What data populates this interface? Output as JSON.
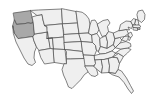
{
  "map": {
    "title": "United States",
    "type": "choropleth",
    "width": 167,
    "height": 109,
    "background_color": "#ffffff",
    "default_fill": "#efefef",
    "highlight_fill": "#a8a8a8",
    "border_color": "#4d4d4d",
    "border_width": 0.7,
    "highlighted_states": [
      "Washington",
      "Oregon"
    ],
    "legend_visible": false,
    "labels_visible": false
  },
  "chart_data": {
    "type": "map",
    "xlabel": "",
    "ylabel": "",
    "categories": [
      "Washington",
      "Oregon",
      "California",
      "Nevada",
      "Idaho",
      "Montana",
      "Wyoming",
      "Utah",
      "Arizona",
      "Colorado",
      "New Mexico",
      "North Dakota",
      "South Dakota",
      "Nebraska",
      "Kansas",
      "Oklahoma",
      "Texas",
      "Minnesota",
      "Iowa",
      "Missouri",
      "Arkansas",
      "Louisiana",
      "Wisconsin",
      "Illinois",
      "Michigan",
      "Indiana",
      "Ohio",
      "Kentucky",
      "Tennessee",
      "Mississippi",
      "Alabama",
      "Georgia",
      "Florida",
      "South Carolina",
      "North Carolina",
      "Virginia",
      "West Virginia",
      "Pennsylvania",
      "New York",
      "Maine",
      "Vermont",
      "New Hampshire",
      "Massachusetts",
      "Rhode Island",
      "Connecticut",
      "New Jersey",
      "Delaware",
      "Maryland"
    ],
    "values": [
      1,
      1,
      0,
      0,
      0,
      0,
      0,
      0,
      0,
      0,
      0,
      0,
      0,
      0,
      0,
      0,
      0,
      0,
      0,
      0,
      0,
      0,
      0,
      0,
      0,
      0,
      0,
      0,
      0,
      0,
      0,
      0,
      0,
      0,
      0,
      0,
      0,
      0,
      0,
      0,
      0,
      0,
      0,
      0,
      0,
      0,
      0,
      0
    ],
    "value_legend": {
      "0": "not selected",
      "1": "selected"
    },
    "colors": {
      "0": "#efefef",
      "1": "#a8a8a8"
    },
    "grid": false,
    "legend_position": "none"
  },
  "states": [
    {
      "name": "Washington",
      "abbr": "WA",
      "selected": true,
      "path": "M13.5,13.0 L30.5,10.6 L32.0,17.0 L33.2,22.5 L31.0,23.4 L28.0,22.8 L25.0,23.6 L16.5,24.4 L14.5,20.0 Z"
    },
    {
      "name": "Oregon",
      "abbr": "OR",
      "selected": true,
      "path": "M14.5,20.0 L16.5,24.4 L25.0,23.6 L28.0,22.8 L31.0,23.4 L33.2,22.5 L34.6,34.0 L33.0,36.5 L18.0,38.6 L14.2,33.0 L12.8,26.0 Z"
    },
    {
      "name": "California",
      "abbr": "CA",
      "selected": false,
      "path": "M12.8,26.0 L14.2,33.0 L18.0,38.6 L33.0,36.5 L34.0,41.0 L36.5,47.0 L34.5,52.0 L34.0,58.0 L35.5,62.5 L32.0,65.5 L28.0,64.0 L24.0,58.0 L20.0,50.0 L16.0,42.0 L13.5,34.0 Z"
    },
    {
      "name": "Nevada",
      "abbr": "NV",
      "selected": false,
      "path": "M33.0,36.5 L34.6,34.0 L47.5,32.0 L50.5,48.5 L39.0,50.5 L36.5,47.0 L34.0,41.0 Z"
    },
    {
      "name": "Idaho",
      "abbr": "ID",
      "selected": false,
      "path": "M33.2,22.5 L32.0,17.0 L37.0,15.5 L42.0,14.5 L43.0,20.0 L44.5,25.5 L47.0,27.0 L47.5,32.0 L34.6,34.0 Z"
    },
    {
      "name": "Montana",
      "abbr": "MT",
      "selected": false,
      "path": "M30.5,10.6 L37.0,15.5 L42.0,14.5 L43.0,20.0 L44.5,25.5 L62.5,23.8 L61.5,9.0 L38.5,10.0 L32.0,10.4 Z"
    },
    {
      "name": "Wyoming",
      "abbr": "WY",
      "selected": false,
      "path": "M44.5,25.5 L62.5,23.8 L63.8,37.0 L47.0,38.5 L47.0,27.0 Z"
    },
    {
      "name": "Utah",
      "abbr": "UT",
      "selected": false,
      "path": "M47.5,32.0 L47.0,38.5 L52.5,38.2 L53.5,49.0 L50.5,48.5 Z"
    },
    {
      "name": "Arizona",
      "abbr": "AZ",
      "selected": false,
      "path": "M39.0,50.5 L50.5,48.5 L53.5,49.0 L54.5,62.5 L44.5,64.0 L41.0,58.0 Z"
    },
    {
      "name": "Colorado",
      "abbr": "CO",
      "selected": false,
      "path": "M47.0,38.5 L63.8,37.0 L65.0,49.5 L53.5,49.0 L52.5,38.2 Z"
    },
    {
      "name": "New Mexico",
      "abbr": "NM",
      "selected": false,
      "path": "M53.5,49.0 L65.0,49.5 L66.5,63.5 L64.0,64.0 L54.5,62.5 Z"
    },
    {
      "name": "North Dakota",
      "abbr": "ND",
      "selected": false,
      "path": "M61.5,9.0 L62.5,23.8 L77.5,23.0 L76.0,11.5 L66.0,9.5 Z"
    },
    {
      "name": "South Dakota",
      "abbr": "SD",
      "selected": false,
      "path": "M62.5,23.8 L77.5,23.0 L79.0,33.5 L63.8,34.5 L63.5,30.0 Z"
    },
    {
      "name": "Nebraska",
      "abbr": "NE",
      "selected": false,
      "path": "M63.8,34.5 L79.0,33.5 L81.5,41.5 L64.2,42.5 L63.8,37.0 Z"
    },
    {
      "name": "Kansas",
      "abbr": "KS",
      "selected": false,
      "path": "M64.2,42.5 L81.5,41.5 L82.5,51.5 L65.0,49.5 Z"
    },
    {
      "name": "Oklahoma",
      "abbr": "OK",
      "selected": false,
      "path": "M65.0,49.5 L82.5,51.5 L84.0,58.5 L70.5,59.0 L66.5,59.0 L66.4,55.5 L66.5,52.0 Z"
    },
    {
      "name": "Texas",
      "abbr": "TX",
      "selected": false,
      "path": "M66.5,63.5 L66.5,59.0 L70.5,59.0 L84.0,58.5 L86.5,62.5 L89.5,67.0 L88.0,72.0 L84.5,74.5 L80.5,80.0 L76.0,84.5 L72.0,88.5 L68.5,87.0 L66.0,80.5 L63.5,75.0 L62.0,69.5 L64.0,64.0 Z"
    },
    {
      "name": "Minnesota",
      "abbr": "MN",
      "selected": false,
      "path": "M76.0,11.5 L77.5,23.0 L79.0,33.5 L88.5,33.0 L90.0,25.0 L89.0,19.0 L86.0,15.0 L82.5,12.5 Z"
    },
    {
      "name": "Iowa",
      "abbr": "IA",
      "selected": false,
      "path": "M79.0,33.5 L88.5,33.0 L92.0,35.0 L92.5,42.5 L81.5,41.5 Z"
    },
    {
      "name": "Missouri",
      "abbr": "MO",
      "selected": false,
      "path": "M81.5,41.5 L92.5,42.5 L95.5,45.5 L96.5,50.5 L94.5,55.5 L83.5,55.0 L82.5,51.5 Z"
    },
    {
      "name": "Arkansas",
      "abbr": "AR",
      "selected": false,
      "path": "M83.5,55.0 L94.5,55.5 L95.5,63.5 L94.0,66.0 L85.0,66.0 L84.0,58.5 Z"
    },
    {
      "name": "Louisiana",
      "abbr": "LA",
      "selected": false,
      "path": "M85.0,66.0 L94.0,66.0 L96.5,69.0 L98.0,74.5 L95.0,76.5 L91.0,75.5 L88.5,72.5 L86.5,69.0 Z"
    },
    {
      "name": "Wisconsin",
      "abbr": "WI",
      "selected": false,
      "path": "M88.5,33.0 L90.0,25.0 L91.5,20.5 L95.0,20.0 L97.5,24.0 L99.0,29.5 L97.0,33.5 L92.0,35.0 Z"
    },
    {
      "name": "Illinois",
      "abbr": "IL",
      "selected": false,
      "path": "M92.0,35.0 L97.0,33.5 L100.0,38.5 L100.5,46.5 L98.5,51.5 L96.5,50.5 L95.5,45.5 L92.5,42.5 Z"
    },
    {
      "name": "Michigan",
      "abbr": "MI",
      "selected": false,
      "path": "M97.5,24.0 L103.0,20.5 L108.0,19.5 L110.0,23.0 L107.5,26.5 L108.5,31.5 L106.0,35.5 L102.0,36.5 L100.0,32.0 L99.0,29.5 Z"
    },
    {
      "name": "Indiana",
      "abbr": "IN",
      "selected": false,
      "path": "M100.0,38.5 L106.0,35.5 L107.5,42.0 L107.0,48.5 L100.5,46.5 Z"
    },
    {
      "name": "Ohio",
      "abbr": "OH",
      "selected": false,
      "path": "M106.0,35.5 L108.5,31.5 L113.5,33.0 L115.0,38.5 L113.5,44.5 L107.0,48.5 L107.5,42.0 Z"
    },
    {
      "name": "Kentucky",
      "abbr": "KY",
      "selected": false,
      "path": "M98.5,51.5 L100.5,46.5 L107.0,48.5 L113.5,44.5 L115.5,47.5 L112.0,51.0 L105.5,53.5 L100.5,54.0 Z"
    },
    {
      "name": "Tennessee",
      "abbr": "TN",
      "selected": false,
      "path": "M94.5,55.5 L100.5,54.0 L105.5,53.5 L112.0,51.0 L115.5,53.0 L113.0,57.0 L104.0,59.5 L95.0,60.0 Z"
    },
    {
      "name": "Mississippi",
      "abbr": "MS",
      "selected": false,
      "path": "M94.0,66.0 L95.5,63.5 L95.0,60.0 L101.5,59.5 L102.5,67.0 L101.5,73.0 L96.5,69.0 Z"
    },
    {
      "name": "Alabama",
      "abbr": "AL",
      "selected": false,
      "path": "M101.5,59.5 L104.0,59.5 L108.5,58.5 L109.5,66.0 L109.0,72.5 L101.5,73.0 L102.5,67.0 Z"
    },
    {
      "name": "Georgia",
      "abbr": "GA",
      "selected": false,
      "path": "M108.5,58.5 L113.0,57.0 L117.5,58.0 L119.5,63.5 L118.0,69.5 L115.5,73.5 L109.0,72.5 L109.5,66.0 Z"
    },
    {
      "name": "Florida",
      "abbr": "FL",
      "selected": false,
      "path": "M109.0,72.5 L115.5,73.5 L118.0,69.5 L121.5,71.0 L126.5,78.0 L130.5,85.5 L133.5,91.0 L131.5,93.5 L128.0,89.0 L124.0,82.5 L119.0,77.0 L113.0,75.0 Z"
    },
    {
      "name": "South Carolina",
      "abbr": "SC",
      "selected": false,
      "path": "M113.0,57.0 L118.5,53.5 L123.5,56.5 L119.5,63.5 L117.5,58.0 Z"
    },
    {
      "name": "North Carolina",
      "abbr": "NC",
      "selected": false,
      "path": "M115.5,53.0 L121.0,49.0 L127.5,48.0 L131.0,49.5 L127.5,53.0 L123.5,56.5 L118.5,53.5 Z"
    },
    {
      "name": "Virginia",
      "abbr": "VA",
      "selected": false,
      "path": "M115.5,47.5 L120.0,43.0 L126.0,41.5 L130.5,43.5 L131.0,46.5 L127.5,48.0 L121.0,49.0 Z"
    },
    {
      "name": "West Virginia",
      "abbr": "WV",
      "selected": false,
      "path": "M113.5,44.5 L115.0,38.5 L119.5,37.5 L122.0,40.0 L120.0,43.0 L115.5,47.5 Z"
    },
    {
      "name": "Pennsylvania",
      "abbr": "PA",
      "selected": false,
      "path": "M113.5,33.0 L119.0,30.5 L126.5,29.5 L128.5,33.5 L124.5,36.5 L119.5,37.5 L115.0,38.5 Z"
    },
    {
      "name": "New York",
      "abbr": "NY",
      "selected": false,
      "path": "M119.0,30.5 L120.5,24.5 L126.0,21.0 L131.0,21.5 L133.0,25.0 L131.5,28.5 L128.0,27.0 L129.5,30.0 L126.5,29.5 Z"
    },
    {
      "name": "Maine",
      "abbr": "ME",
      "selected": false,
      "path": "M138.5,11.0 L142.5,10.0 L145.0,14.5 L144.5,19.5 L141.5,22.5 L138.0,20.0 L137.0,15.0 Z"
    },
    {
      "name": "Vermont",
      "abbr": "VT",
      "selected": false,
      "path": "M131.0,21.5 L133.5,18.5 L136.0,19.5 L135.0,24.0 L133.0,25.0 Z"
    },
    {
      "name": "New Hampshire",
      "abbr": "NH",
      "selected": false,
      "path": "M136.0,19.5 L138.0,20.0 L139.0,25.0 L136.5,25.5 L135.0,24.0 Z"
    },
    {
      "name": "Massachusetts",
      "abbr": "MA",
      "selected": false,
      "path": "M133.0,25.0 L139.0,25.0 L141.0,26.5 L139.0,28.0 L133.5,27.5 Z"
    },
    {
      "name": "Rhode Island",
      "abbr": "RI",
      "selected": false,
      "path": "M138.0,28.0 L140.0,28.0 L140.0,29.5 L138.0,29.5 Z"
    },
    {
      "name": "Connecticut",
      "abbr": "CT",
      "selected": false,
      "path": "M133.5,27.5 L137.5,28.0 L137.5,30.5 L133.5,30.0 Z"
    },
    {
      "name": "New Jersey",
      "abbr": "NJ",
      "selected": false,
      "path": "M128.5,33.5 L131.0,32.0 L132.5,35.5 L130.5,38.0 L128.5,36.0 Z"
    },
    {
      "name": "Delaware",
      "abbr": "DE",
      "selected": false,
      "path": "M128.5,36.0 L130.5,38.0 L129.5,40.5 L127.8,39.5 Z"
    },
    {
      "name": "Maryland",
      "abbr": "MD",
      "selected": false,
      "path": "M124.5,36.5 L128.5,36.0 L127.8,39.5 L126.0,41.5 L122.0,40.0 Z"
    }
  ]
}
